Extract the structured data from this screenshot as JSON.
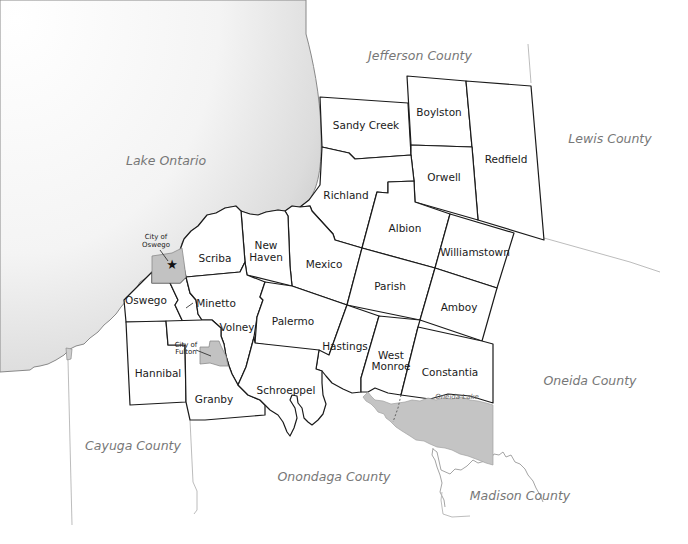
{
  "map": {
    "water_bodies": [
      {
        "name": "Lake Ontario",
        "label": "Lake Ontario"
      },
      {
        "name": "Oneida Lake",
        "label": "Oneida Lake"
      }
    ],
    "counties": {
      "jefferson": "Jefferson County",
      "lewis": "Lewis County",
      "oneida": "Oneida County",
      "madison": "Madison County",
      "onondaga": "Onondaga County",
      "cayuga": "Cayuga County"
    },
    "towns": {
      "sandy_creek": "Sandy Creek",
      "boylston": "Boylston",
      "redfield": "Redfield",
      "orwell": "Orwell",
      "richland": "Richland",
      "albion": "Albion",
      "williamstown": "Williamstown",
      "new_haven_1": "New",
      "new_haven_2": "Haven",
      "mexico": "Mexico",
      "scriba": "Scriba",
      "parish": "Parish",
      "amboy": "Amboy",
      "oswego": "Oswego",
      "minetto": "Minetto",
      "volney": "Volney",
      "palermo": "Palermo",
      "hastings": "Hastings",
      "west_monroe_1": "West",
      "west_monroe_2": "Monroe",
      "constantia": "Constantia",
      "hannibal": "Hannibal",
      "granby": "Granby",
      "schroeppel": "Schroeppel"
    },
    "cities": {
      "oswego_1": "City of",
      "oswego_2": "Oswego",
      "fulton_1": "City of",
      "fulton_2": "Fulton"
    },
    "markers": [
      {
        "name": "county-seat",
        "symbol": "★",
        "city": "City of Oswego"
      }
    ],
    "colors": {
      "town_stroke": "#1a1a1a",
      "city_fill": "#c2c2c2",
      "oneida_lake_fill": "#c4c4c4",
      "lake_ontario_gradient_start": "#ffffff",
      "lake_ontario_gradient_end": "#c8c8c8",
      "county_label": "#777777"
    }
  }
}
